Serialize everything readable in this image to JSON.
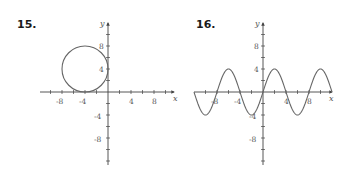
{
  "problems": [
    {
      "number": "15.",
      "x_axis_label": "x",
      "y_axis_label": "y",
      "x_ticks": [
        "-8",
        "-4",
        "4",
        "8"
      ],
      "y_ticks": [
        "8",
        "4",
        "-4",
        "-8"
      ]
    },
    {
      "number": "16.",
      "x_axis_label": "x",
      "y_axis_label": "y",
      "x_ticks": [
        "-8",
        "-4",
        "4",
        "8"
      ],
      "y_ticks": [
        "8",
        "4",
        "-4",
        "-8"
      ]
    }
  ],
  "chart_data": [
    {
      "type": "line",
      "title": "15.",
      "description": "Circle centered at (-4, 4) with radius 4",
      "shape": "circle",
      "center": [
        -4,
        4
      ],
      "radius": 4,
      "xlabel": "x",
      "ylabel": "y",
      "xlim": [
        -12,
        12
      ],
      "ylim": [
        -12,
        12
      ],
      "x_tick_labels": [
        "-8",
        "-4",
        "4",
        "8"
      ],
      "y_tick_labels": [
        "8",
        "4",
        "-4",
        "-8"
      ],
      "grid": false
    },
    {
      "type": "line",
      "title": "16.",
      "description": "Sinusoid y = 4 sin(pi x / 4)",
      "amplitude": 4,
      "period": 8,
      "x": [
        -12,
        -10,
        -8,
        -6,
        -4,
        -2,
        0,
        2,
        4,
        6,
        8,
        10,
        12
      ],
      "values": [
        0,
        -4,
        0,
        4,
        0,
        -4,
        0,
        4,
        0,
        -4,
        0,
        4,
        0
      ],
      "xlabel": "x",
      "ylabel": "y",
      "xlim": [
        -12,
        12
      ],
      "ylim": [
        -12,
        12
      ],
      "x_tick_labels": [
        "-8",
        "-4",
        "4",
        "8"
      ],
      "y_tick_labels": [
        "8",
        "4",
        "-4",
        "-8"
      ],
      "grid": false
    }
  ]
}
